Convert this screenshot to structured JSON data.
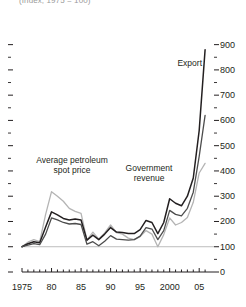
{
  "chart_data": {
    "type": "line",
    "title": "(Index, 1975 = 100)",
    "xlabel": "",
    "ylabel": "",
    "xlim": [
      1975,
      2007
    ],
    "ylim": [
      0,
      950
    ],
    "grid": false,
    "baseline_value": 100,
    "legend_position": "inline-annotations",
    "x_tick_labels": [
      "1975",
      "80",
      "85",
      "90",
      "95",
      "2000",
      "05"
    ],
    "x_tick_values": [
      1975,
      1980,
      1985,
      1990,
      1995,
      2000,
      2005
    ],
    "x_minor_tick_step": 1,
    "y_tick_labels": [
      "0",
      "100",
      "200",
      "300",
      "400",
      "500",
      "600",
      "700",
      "800",
      "900"
    ],
    "y_tick_values": [
      0,
      100,
      200,
      300,
      400,
      500,
      600,
      700,
      800,
      900
    ],
    "y_minor_tick_values": [
      50,
      150,
      250,
      350,
      450,
      550,
      650,
      750,
      850
    ],
    "x": [
      1975,
      1976,
      1977,
      1978,
      1979,
      1980,
      1981,
      1982,
      1983,
      1984,
      1985,
      1986,
      1987,
      1988,
      1989,
      1990,
      1991,
      1992,
      1993,
      1994,
      1995,
      1996,
      1997,
      1998,
      1999,
      2000,
      2001,
      2002,
      2003,
      2004,
      2005,
      2006
    ],
    "series": [
      {
        "name": "Average petroleum spot price",
        "color": "#b4b4b4",
        "width": 1.3,
        "values": [
          100,
          118,
          128,
          120,
          228,
          318,
          300,
          280,
          252,
          240,
          232,
          126,
          158,
          130,
          155,
          186,
          156,
          150,
          134,
          128,
          140,
          164,
          150,
          100,
          148,
          214,
          186,
          196,
          216,
          276,
          392,
          430
        ]
      },
      {
        "name": "Export",
        "color": "#231f20",
        "width": 1.5,
        "values": [
          100,
          112,
          120,
          116,
          178,
          238,
          226,
          212,
          206,
          210,
          206,
          126,
          146,
          128,
          150,
          176,
          158,
          156,
          152,
          152,
          168,
          204,
          196,
          152,
          196,
          290,
          272,
          262,
          300,
          372,
          560,
          880
        ]
      },
      {
        "name": "Government revenue",
        "color": "#4d4d4d",
        "width": 1.3,
        "values": [
          100,
          106,
          112,
          108,
          150,
          214,
          206,
          196,
          190,
          192,
          188,
          110,
          120,
          104,
          122,
          144,
          130,
          128,
          126,
          128,
          142,
          176,
          170,
          128,
          164,
          244,
          228,
          222,
          252,
          316,
          458,
          620
        ]
      }
    ],
    "annotations": [
      {
        "id": "petroleum",
        "text_lines": [
          "Average petroleum",
          "spot price"
        ]
      },
      {
        "id": "government",
        "text_lines": [
          "Government",
          "revenue"
        ]
      },
      {
        "id": "export",
        "text_lines": [
          "Export"
        ]
      }
    ]
  }
}
